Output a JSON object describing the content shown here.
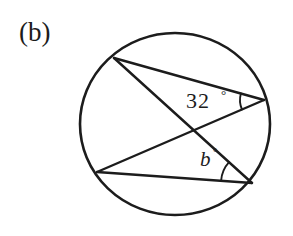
{
  "figure": {
    "part_label": "(b)",
    "shape": "circle",
    "circle": {
      "center_x": 175,
      "center_y": 124,
      "radius_x": 95,
      "radius_y": 91,
      "stroke_color": "#1c1c1c"
    },
    "points": [
      {
        "id": "A",
        "x": 114,
        "y": 58,
        "position": "top-left"
      },
      {
        "id": "B",
        "x": 264,
        "y": 100,
        "position": "right"
      },
      {
        "id": "C",
        "x": 97,
        "y": 172,
        "position": "bottom-left"
      },
      {
        "id": "D",
        "x": 252,
        "y": 183,
        "position": "bottom-right"
      }
    ],
    "chords": [
      {
        "id": "chord-AB",
        "from": "A",
        "to": "B"
      },
      {
        "id": "chord-AD",
        "from": "A",
        "to": "D"
      },
      {
        "id": "chord-CB",
        "from": "C",
        "to": "B"
      },
      {
        "id": "chord-CD",
        "from": "C",
        "to": "D"
      }
    ],
    "angles": [
      {
        "id": "angle-32",
        "vertex": "B",
        "value": "32",
        "degree_symbol": "°",
        "label_x": 186,
        "label_y": 108,
        "arc_radius": 24
      },
      {
        "id": "angle-b",
        "vertex": "D",
        "value": "b",
        "degree_symbol": "°",
        "label_x": 199,
        "label_y": 165,
        "arc_radius": 31
      }
    ]
  },
  "colors": {
    "ink": "#1c1c1c",
    "background": "#ffffff"
  }
}
